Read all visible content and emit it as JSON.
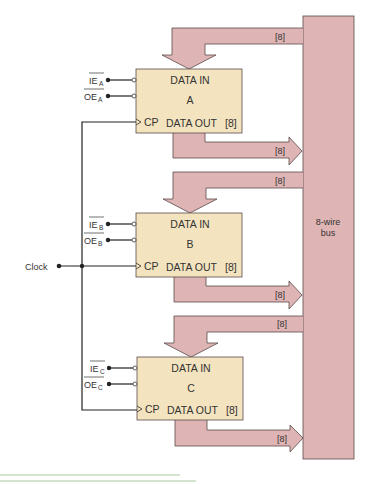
{
  "diagram": {
    "colors": {
      "bus_fill": "#dfb4b4",
      "bus_stroke": "#5a4a4a",
      "register_fill": "#f3e3bf",
      "register_stroke": "#5a4a4a",
      "wire": "#222222",
      "rule": "#a8c8a0"
    },
    "bus": {
      "label_line1": "8-wire",
      "label_line2": "bus"
    },
    "width_label": "[8]",
    "clock": {
      "label": "Clock"
    },
    "registers": [
      {
        "name": "A",
        "data_in": "DATA IN",
        "data_out": "DATA OUT",
        "out_width": "[8]",
        "cp": "CP",
        "ie_label": "IE",
        "oe_label": "OE",
        "subscript": "A",
        "in_bus_label": "[8]",
        "out_bus_label": "[8]"
      },
      {
        "name": "B",
        "data_in": "DATA IN",
        "data_out": "DATA OUT",
        "out_width": "[8]",
        "cp": "CP",
        "ie_label": "IE",
        "oe_label": "OE",
        "subscript": "B",
        "in_bus_label": "[8]",
        "out_bus_label": "[8]"
      },
      {
        "name": "C",
        "data_in": "DATA IN",
        "data_out": "DATA OUT",
        "out_width": "[8]",
        "cp": "CP",
        "ie_label": "IE",
        "oe_label": "OE",
        "subscript": "C",
        "in_bus_label": "[8]",
        "out_bus_label": "[8]"
      }
    ]
  }
}
